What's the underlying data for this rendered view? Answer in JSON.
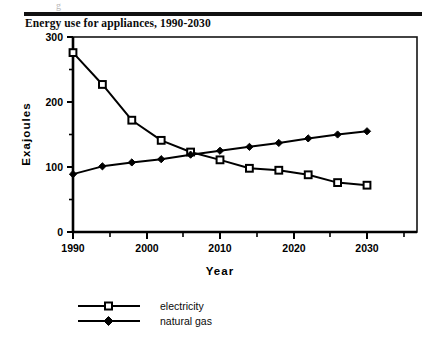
{
  "header": {
    "ghost_mark": "g"
  },
  "figure": {
    "title": "Energy use for appliances, 1990-2030"
  },
  "chart_data": {
    "type": "line",
    "title": "Energy use for appliances, 1990-2030",
    "xlabel": "Year",
    "ylabel": "Exajoules",
    "xlim": [
      1990,
      2030
    ],
    "ylim": [
      0,
      300
    ],
    "x_ticks": [
      1990,
      2000,
      2010,
      2020,
      2030
    ],
    "x_tick_labels": [
      "1990",
      "2000",
      "2010",
      "2020",
      "2030"
    ],
    "x_minor_ticks": [
      1995,
      2005,
      2015,
      2025
    ],
    "y_ticks": [
      0,
      100,
      200,
      300
    ],
    "y_tick_labels": [
      "0",
      "100",
      "200",
      "300"
    ],
    "y_minor_ticks": [
      50,
      150,
      250
    ],
    "grid": false,
    "legend_position": "below",
    "frame": true,
    "x": [
      1990,
      1994,
      1998,
      2002,
      2006,
      2010,
      2014,
      2018,
      2022,
      2026,
      2030
    ],
    "series": [
      {
        "name": "electricity",
        "marker": "open-square",
        "values": [
          276,
          227,
          172,
          141,
          123,
          111,
          98,
          95,
          88,
          76,
          72
        ]
      },
      {
        "name": "natural gas",
        "marker": "filled-diamond",
        "values": [
          89,
          101,
          107,
          112,
          119,
          125,
          131,
          137,
          144,
          150,
          155
        ]
      }
    ]
  },
  "legend": {
    "items": [
      {
        "label": "electricity"
      },
      {
        "label": "natural gas"
      }
    ]
  }
}
